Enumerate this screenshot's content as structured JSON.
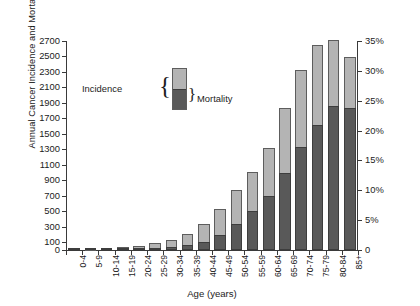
{
  "chart_data": {
    "type": "bar",
    "stacked": true,
    "title": "",
    "xlabel": "Age (years)",
    "ylabel": "Annual Cancer Incidence and Mortality/100,000 Population",
    "y2label": "",
    "ylim": [
      0,
      2700
    ],
    "y2lim": [
      0,
      35
    ],
    "yticks": [
      0,
      100,
      300,
      500,
      700,
      900,
      1100,
      1300,
      1500,
      1700,
      1900,
      2100,
      2300,
      2500,
      2700
    ],
    "yticklabels": [
      "0",
      "100",
      "300",
      "500",
      "700",
      "900",
      "1100",
      "1300",
      "1500",
      "1700",
      "1900",
      "2100",
      "2300",
      "2500",
      "2700"
    ],
    "y2ticks": [
      0,
      5,
      10,
      15,
      20,
      25,
      30,
      35
    ],
    "y2ticklabels": [
      "0",
      "5%",
      "10%",
      "15%",
      "20%",
      "25%",
      "30%",
      "35%"
    ],
    "grid": false,
    "categories": [
      "0-4",
      "5-9",
      "10-14",
      "15-19",
      "20-24",
      "25-29",
      "30-34",
      "35-39",
      "40-44",
      "45-49",
      "50-54",
      "55-59",
      "60-64",
      "65-69",
      "70-74",
      "75-79",
      "80-84",
      "85+"
    ],
    "series": [
      {
        "name": "Incidence",
        "color": "#b4b4b4",
        "values": [
          20,
          15,
          20,
          35,
          55,
          90,
          135,
          205,
          330,
          530,
          770,
          1010,
          1320,
          1830,
          2330,
          2650,
          2710,
          2490
        ]
      },
      {
        "name": "Mortality",
        "color": "#595959",
        "values": [
          5,
          4,
          5,
          8,
          12,
          20,
          35,
          60,
          110,
          200,
          330,
          500,
          700,
          1000,
          1330,
          1620,
          1860,
          1840
        ]
      }
    ],
    "legend": {
      "position": "upper-left-inside",
      "incidence_label": "Incidence",
      "mortality_label": "Mortality",
      "incidence_brace": "{",
      "mortality_brace": "}"
    }
  }
}
